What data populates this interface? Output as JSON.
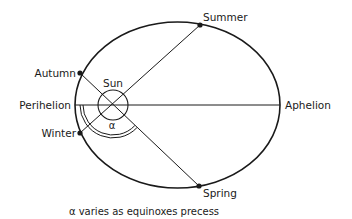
{
  "diagram": {
    "labels": {
      "sun": "Sun",
      "summer": "Summer",
      "autumn": "Autumn",
      "winter": "Winter",
      "spring": "Spring",
      "perihelion": "Perihelion",
      "aphelion": "Aphelion",
      "angle": "α"
    },
    "caption": "α varies as equinoxes precess",
    "colors": {
      "ink": "#1a1a1a",
      "background": "#ffffff"
    }
  }
}
